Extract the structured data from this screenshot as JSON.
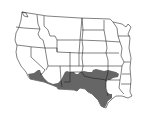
{
  "map": {
    "title": "",
    "subject": "Western and central United States range map",
    "range_fill": "#666666",
    "state_fill": "#ffffff",
    "border_color": "#1a1a1a",
    "background": "#ffffff",
    "shaded_regions": [
      "Southern California",
      "Southern Arizona",
      "New Mexico",
      "West Texas",
      "Central Texas",
      "South Texas",
      "Southern Oklahoma"
    ],
    "states_shown": [
      "WA",
      "OR",
      "CA",
      "ID",
      "NV",
      "MT",
      "WY",
      "UT",
      "AZ",
      "CO",
      "NM",
      "ND",
      "SD",
      "NE",
      "KS",
      "OK",
      "TX",
      "MN",
      "IA",
      "MO",
      "AR",
      "LA",
      "WI",
      "IL",
      "MS"
    ]
  }
}
